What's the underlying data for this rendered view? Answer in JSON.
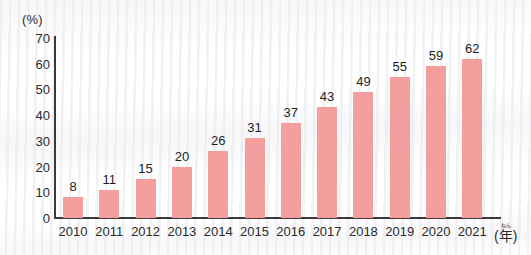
{
  "chart_data": {
    "type": "bar",
    "title": "",
    "subtitle": "",
    "xlabel": "年",
    "xlabel_reading": "ねん",
    "xlabel_display": "(年)",
    "ylabel": "(%)",
    "categories": [
      "2010",
      "2011",
      "2012",
      "2013",
      "2014",
      "2015",
      "2016",
      "2017",
      "2018",
      "2019",
      "2020",
      "2021"
    ],
    "values": [
      8,
      11,
      15,
      20,
      26,
      31,
      37,
      43,
      49,
      55,
      59,
      62
    ],
    "ylim": [
      0,
      70
    ],
    "ytick_step": 10,
    "yticks": [
      "70",
      "60",
      "50",
      "40",
      "30",
      "20",
      "10",
      "0"
    ],
    "ytick_values": [
      70,
      60,
      50,
      40,
      30,
      20,
      10,
      0
    ],
    "grid": false,
    "legend": false,
    "legend_position": "none",
    "data_labels": [
      "8",
      "11",
      "15",
      "20",
      "26",
      "31",
      "37",
      "43",
      "49",
      "55",
      "59",
      "62"
    ],
    "colors": {
      "bar": "#f49e9e",
      "axis": "#3a3a3a",
      "text": "#2b2b2b",
      "background": "#ffffff"
    }
  }
}
